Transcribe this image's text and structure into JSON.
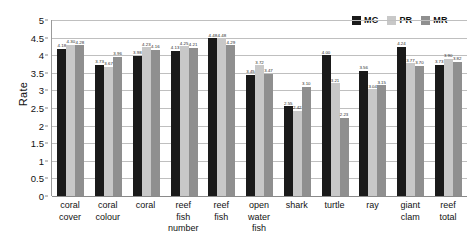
{
  "chart_data": {
    "type": "bar",
    "title": "",
    "xlabel": "",
    "ylabel": "Rate",
    "ylim": [
      0,
      5
    ],
    "ytick_step": 0.5,
    "yticks": [
      "5",
      "4.5",
      "4",
      "3.5",
      "3",
      "2.5",
      "2",
      "1.5",
      "1",
      "0.5",
      "0"
    ],
    "grid": true,
    "legend_position": "top-right",
    "categories": [
      "coral cover",
      "coral colour",
      "coral",
      "reef fish number",
      "reef fish",
      "open water fish",
      "shark",
      "turtle",
      "ray",
      "giant clam",
      "reef total"
    ],
    "category_lines": [
      [
        "coral",
        "cover"
      ],
      [
        "coral",
        "colour"
      ],
      [
        "coral"
      ],
      [
        "reef",
        "fish",
        "number"
      ],
      [
        "reef",
        "fish"
      ],
      [
        "open",
        "water",
        "fish"
      ],
      [
        "shark"
      ],
      [
        "turtle"
      ],
      [
        "ray"
      ],
      [
        "giant",
        "clam"
      ],
      [
        "reef",
        "total"
      ]
    ],
    "series": [
      {
        "name": "MC",
        "color": "#1a1a1a",
        "values": [
          4.18,
          3.73,
          3.98,
          4.13,
          4.48,
          3.45,
          2.55,
          4.0,
          3.56,
          4.24,
          3.73
        ],
        "labels": [
          "4.18",
          "3.73",
          "3.98",
          "4.13",
          "4.48",
          "3.45",
          "2.55",
          "4.00",
          "3.56",
          "4.24",
          "3.73"
        ]
      },
      {
        "name": "PR",
        "color": "#c8c8c8",
        "values": [
          4.3,
          3.67,
          4.23,
          4.25,
          4.48,
          3.72,
          2.42,
          3.21,
          3.04,
          3.77,
          3.9
        ],
        "labels": [
          "4.30",
          "3.67",
          "4.23",
          "4.25",
          "4.48",
          "3.72",
          "2.42",
          "3.21",
          "3.04",
          "3.77",
          "3.90"
        ]
      },
      {
        "name": "MR",
        "color": "#8f8f8f",
        "values": [
          4.28,
          3.96,
          4.16,
          4.21,
          4.29,
          3.47,
          3.1,
          2.23,
          3.15,
          3.7,
          3.82
        ],
        "labels": [
          "4.28",
          "3.96",
          "4.16",
          "4.21",
          "4.29",
          "3.47",
          "3.10",
          "2.23",
          "3.15",
          "3.70",
          "3.82"
        ]
      }
    ]
  },
  "legend": {
    "entries": [
      {
        "label": "MC",
        "color": "#1a1a1a"
      },
      {
        "label": "PR",
        "color": "#c8c8c8"
      },
      {
        "label": "MR",
        "color": "#8f8f8f"
      }
    ]
  },
  "colors": {
    "mc": "#1a1a1a",
    "pr": "#c8c8c8",
    "mr": "#8f8f8f",
    "gridline": "#bfbfbf",
    "axis": "#8a8a8a",
    "text": "#111111",
    "background": "#ffffff"
  }
}
